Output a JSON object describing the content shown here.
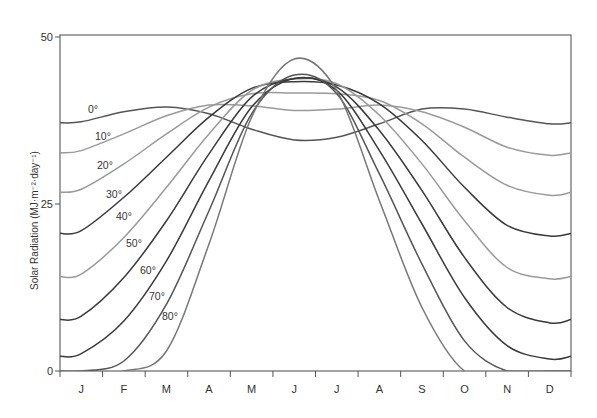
{
  "chart_data": {
    "type": "line",
    "title": "",
    "xlabel": "",
    "ylabel": "Solar Radiation (MJ·m⁻²·day⁻¹)",
    "ylim": [
      0,
      50
    ],
    "yticks": [
      0,
      25,
      50
    ],
    "categories": [
      "J",
      "F",
      "M",
      "A",
      "M",
      "J",
      "J",
      "A",
      "S",
      "O",
      "N",
      "D"
    ],
    "grid": false,
    "legend": "inline labels on curves",
    "series": [
      {
        "name": "0°",
        "label": "0°",
        "color": "#555555",
        "values": [
          37.3,
          38.8,
          39.5,
          38.5,
          36.2,
          34.6,
          35.0,
          37.0,
          39.2,
          39.2,
          38.0,
          37.0
        ]
      },
      {
        "name": "10°",
        "label": "10°",
        "color": "#9a9a9a",
        "values": [
          33.0,
          35.5,
          38.2,
          39.8,
          39.7,
          39.0,
          39.2,
          39.8,
          38.8,
          36.5,
          33.5,
          32.3
        ]
      },
      {
        "name": "20°",
        "label": "20°",
        "color": "#9a9a9a",
        "values": [
          27.2,
          31.0,
          35.5,
          39.5,
          41.5,
          41.6,
          41.5,
          40.5,
          37.0,
          32.0,
          27.8,
          26.3
        ]
      },
      {
        "name": "30°",
        "label": "30°",
        "color": "#3a3a3a",
        "values": [
          21.0,
          26.0,
          32.0,
          38.0,
          42.3,
          43.3,
          42.8,
          40.0,
          34.5,
          27.5,
          21.8,
          20.2
        ]
      },
      {
        "name": "40°",
        "label": "40°",
        "color": "#9a9a9a",
        "values": [
          14.5,
          20.0,
          27.5,
          35.5,
          42.0,
          43.7,
          43.0,
          38.3,
          31.0,
          22.5,
          15.5,
          13.8
        ]
      },
      {
        "name": "50°",
        "label": "50°",
        "color": "#3a3a3a",
        "values": [
          8.2,
          14.0,
          22.5,
          32.5,
          41.0,
          43.8,
          42.5,
          36.0,
          27.0,
          17.0,
          9.5,
          7.2
        ]
      },
      {
        "name": "60°",
        "label": "60°",
        "color": "#3a3a3a",
        "values": [
          2.6,
          7.5,
          16.5,
          28.5,
          39.5,
          43.8,
          42.0,
          33.0,
          22.0,
          11.0,
          3.8,
          1.8
        ]
      },
      {
        "name": "70°",
        "label": "70°",
        "color": "#555555",
        "values": [
          0,
          1.5,
          10.0,
          24.0,
          38.5,
          44.3,
          41.5,
          29.5,
          16.0,
          4.5,
          0,
          0
        ]
      },
      {
        "name": "80°",
        "label": "80°",
        "color": "#777777",
        "values": [
          0,
          0,
          3.0,
          19.0,
          38.0,
          46.7,
          42.0,
          25.5,
          9.5,
          0,
          0,
          0
        ]
      }
    ]
  },
  "axes": {
    "y_tick_labels": [
      "0",
      "25",
      "50"
    ],
    "y_label": "Solar Radiation (MJ·m⁻²·day⁻¹)"
  }
}
